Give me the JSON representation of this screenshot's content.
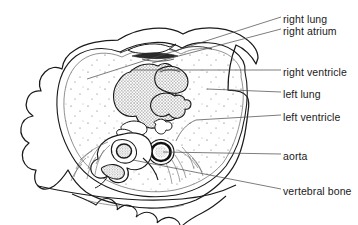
{
  "figure": {
    "background_color": "#ffffff",
    "ink_color": "#1a1a1a"
  },
  "labels": [
    {
      "id": "right-lung",
      "text": "right lung",
      "x": 283,
      "y": 13,
      "leader": {
        "from_x": 281,
        "from_y": 17,
        "to_x": 87,
        "to_y": 79
      }
    },
    {
      "id": "right-atrium",
      "text": "right atrium",
      "x": 283,
      "y": 25,
      "leader": {
        "from_x": 281,
        "from_y": 29,
        "to_x": 152,
        "to_y": 63
      }
    },
    {
      "id": "right-ventricle",
      "text": "right ventricle",
      "x": 283,
      "y": 66,
      "leader": {
        "from_x": 281,
        "from_y": 70,
        "to_x": 131,
        "to_y": 70
      }
    },
    {
      "id": "left-lung",
      "text": "left lung",
      "x": 283,
      "y": 88,
      "leader": {
        "from_x": 281,
        "from_y": 92,
        "to_x": 207,
        "to_y": 89
      }
    },
    {
      "id": "left-ventricle",
      "text": "left ventricle",
      "x": 283,
      "y": 111,
      "leader": {
        "from_x": 281,
        "from_y": 115,
        "to_x": 176,
        "to_y": 141
      }
    },
    {
      "id": "aorta",
      "text": "aorta",
      "x": 283,
      "y": 150,
      "leader": {
        "from_x": 281,
        "from_y": 154,
        "to_x": 163,
        "to_y": 152
      }
    },
    {
      "id": "vertebral-bone",
      "text": "vertebral bone",
      "x": 283,
      "y": 185,
      "leader": {
        "from_x": 281,
        "from_y": 189,
        "to_x": 133,
        "to_y": 160
      }
    }
  ],
  "structures": {
    "body_wall": "outer skin contour",
    "muscle_layer": "inner chest wall layer",
    "lung_fields": "stippled lung parenchyma",
    "heart": "central cardiac silhouette",
    "right_ventricle": "large anterior stippled chamber",
    "right_atrium": "upper right chamber",
    "left_ventricle": "posterior left chamber",
    "aorta": "descending aorta ring",
    "vertebral_body": "vertebral bone with spinal canal"
  }
}
